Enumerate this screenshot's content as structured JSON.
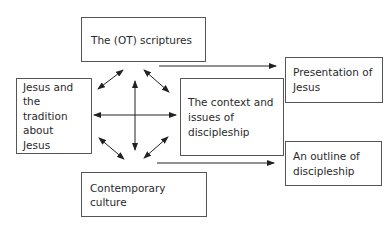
{
  "diagram": {
    "nodes": {
      "scriptures": {
        "label": "The (OT) scriptures"
      },
      "jesus": {
        "label": "Jesus and the tradition about Jesus"
      },
      "context": {
        "label": "The context and issues of discipleship"
      },
      "culture": {
        "label": "Contemporary culture"
      },
      "presentation": {
        "label": "Presentation of Jesus"
      },
      "outline": {
        "label": "An outline of discipleship"
      }
    },
    "edges": [
      {
        "from": "scriptures",
        "to": "jesus",
        "type": "bidirectional"
      },
      {
        "from": "scriptures",
        "to": "context",
        "type": "bidirectional"
      },
      {
        "from": "scriptures",
        "to": "culture",
        "type": "bidirectional"
      },
      {
        "from": "jesus",
        "to": "context",
        "type": "bidirectional"
      },
      {
        "from": "jesus",
        "to": "culture",
        "type": "bidirectional"
      },
      {
        "from": "context",
        "to": "culture",
        "type": "bidirectional"
      },
      {
        "from": "context",
        "to": "presentation",
        "type": "directed"
      },
      {
        "from": "context",
        "to": "outline",
        "type": "directed"
      }
    ],
    "colors": {
      "line": "#333333",
      "border": "#555555"
    }
  }
}
